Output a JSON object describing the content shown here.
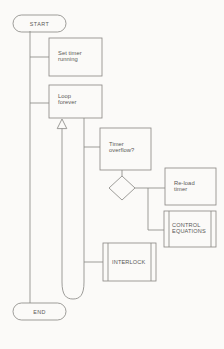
{
  "diagram": {
    "background_color": "#fbfaf8",
    "line_color": "#8d8b88",
    "text_color": "#5a5856",
    "nodes": {
      "start": {
        "label": "START",
        "shape": "terminator"
      },
      "set_timer": {
        "label": "Set timer\nrunning",
        "shape": "process"
      },
      "loop_forever": {
        "label": "Loop\nforever",
        "shape": "process"
      },
      "timer_overflow": {
        "label": "Timer\noverflow?",
        "shape": "process"
      },
      "decision": {
        "label": "",
        "shape": "decision"
      },
      "reload_timer": {
        "label": "Re-load\ntimer",
        "shape": "process"
      },
      "control_equations": {
        "label": "CONTROL\nEQUATIONS",
        "shape": "subroutine"
      },
      "interlock": {
        "label": "INTERLOCK",
        "shape": "subroutine"
      },
      "end": {
        "label": "END",
        "shape": "terminator"
      }
    },
    "connectors": {
      "loop_back_arrow": "hollow-triangle-up",
      "main_spine": "start-to-end",
      "loop_spine": "loop-forever-to-u-turn"
    }
  }
}
